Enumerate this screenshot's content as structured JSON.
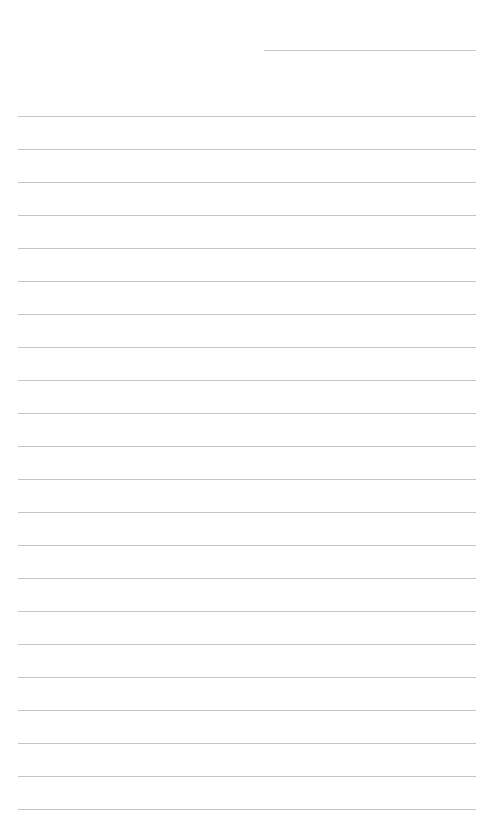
{
  "page": {
    "type": "blank lined paper",
    "header_line": {
      "x": 264,
      "y": 50,
      "width": 212
    },
    "ruled_lines": {
      "count": 22,
      "start_y": 116,
      "spacing": 33,
      "x": 18,
      "width": 458,
      "color": "#c4c4c4"
    }
  }
}
